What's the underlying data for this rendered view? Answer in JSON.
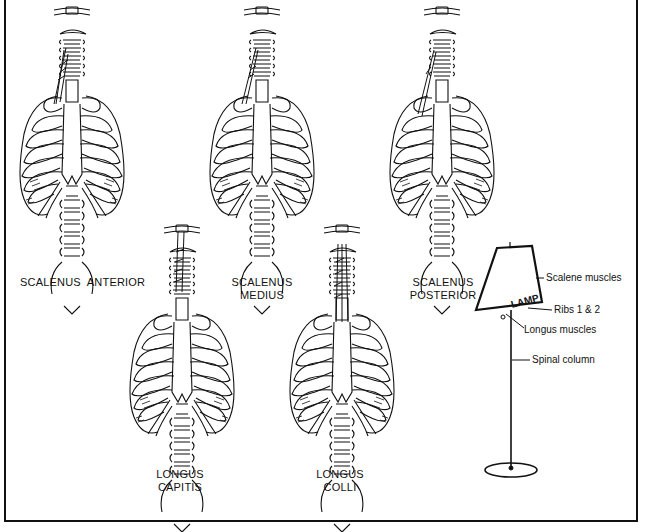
{
  "figure": {
    "panels": [
      {
        "id": "scalenus-anterior",
        "label_lines": [
          "SCALENUS  ANTERIOR"
        ]
      },
      {
        "id": "scalenus-medius",
        "label_lines": [
          "SCALENUS",
          "MEDIUS"
        ]
      },
      {
        "id": "scalenus-posterior",
        "label_lines": [
          "SCALENUS",
          "POSTERIOR"
        ]
      },
      {
        "id": "longus-capitis",
        "label_lines": [
          "LONGUS",
          "CAPITIS"
        ]
      },
      {
        "id": "longus-colli",
        "label_lines": [
          "LONGUS",
          "COLLI"
        ]
      }
    ],
    "lamp_analogy": {
      "shade_text": "LAMP",
      "callouts": [
        {
          "text": "Scalene muscles"
        },
        {
          "text": "Ribs 1 & 2"
        },
        {
          "text": "Longus muscles"
        },
        {
          "text": "Spinal column"
        }
      ]
    },
    "colors": {
      "ink": "#111111",
      "background": "#ffffff"
    }
  }
}
